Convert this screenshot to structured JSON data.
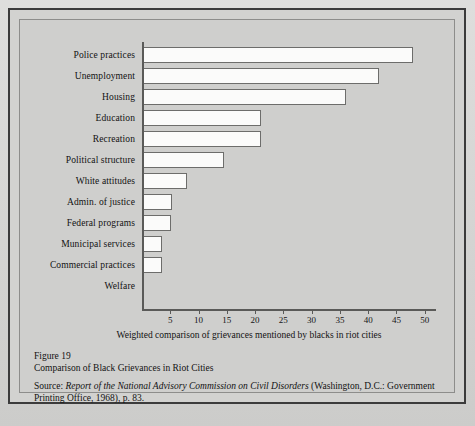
{
  "figure": {
    "number": "Figure 19",
    "title": "Comparison of Black Grievances in Riot Cities",
    "source_label": "Source:",
    "source_italic": "Report of the National Advisory Commission on Civil Disorders",
    "source_rest": " (Washington, D.C.: Government Printing Office, 1968), p. 83."
  },
  "chart_data": {
    "type": "bar",
    "orientation": "horizontal",
    "title": "Comparison of Black Grievances in Riot Cities",
    "xlabel": "Weighted comparison of grievances mentioned by blacks in riot cities",
    "ylabel": "",
    "xlim": [
      0,
      52
    ],
    "grid": false,
    "legend": null,
    "categories": [
      "Police practices",
      "Unemployment",
      "Housing",
      "Education",
      "Recreation",
      "Political structure",
      "White attitudes",
      "Admin. of justice",
      "Federal programs",
      "Municipal services",
      "Commercial practices",
      "Welfare"
    ],
    "values": [
      48,
      42,
      36,
      21,
      21,
      14.5,
      8,
      5.3,
      5.2,
      3.5,
      3.5,
      0
    ],
    "tick_values": [
      5,
      10,
      15,
      20,
      25,
      30,
      35,
      40,
      45,
      50
    ],
    "tick_labels": [
      "5",
      "10",
      "15",
      "20",
      "25",
      "30",
      "35",
      "40",
      "45",
      "50"
    ],
    "bar_fill": "#fbfbfa",
    "bar_stroke": "#6d6d6b",
    "axis_color": "#5a5a58",
    "background": "#cfcfcd"
  }
}
